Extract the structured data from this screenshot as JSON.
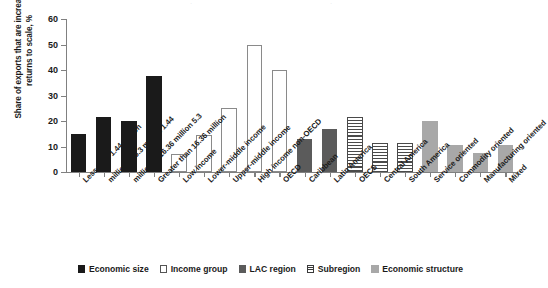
{
  "chart_data": {
    "type": "bar",
    "title": "",
    "subtitle": "",
    "xlabel": "",
    "ylabel": "Share of exports that are increasing returns to scale, %",
    "ylim": [
      0,
      60
    ],
    "yticks": [
      0,
      10,
      20,
      30,
      40,
      50,
      60
    ],
    "grid": false,
    "legend_position": "bottom",
    "categories": [
      "Less than 1.44 million",
      "1.44 million to 5.3 million",
      "5.3 million to 16.36 million",
      "Greater than 16.36 million",
      "Low income",
      "Lower-middle income",
      "Upper-middle income",
      "High income non-OECD",
      "OECD",
      "Caribbean",
      "Latin America",
      "OECS",
      "Central America",
      "South America",
      "Service oriented",
      "Commodity oriented",
      "Manufacturing oriented",
      "Mixed"
    ],
    "values": [
      15,
      21.5,
      20.2,
      37.5,
      7,
      14.5,
      25,
      50,
      40,
      13,
      17,
      21.5,
      11.5,
      11.5,
      20,
      10.5,
      7.5,
      10.5
    ],
    "groups": [
      "Economic size",
      "Economic size",
      "Economic size",
      "Economic size",
      "Income group",
      "Income group",
      "Income group",
      "Income group",
      "Income group",
      "LAC region",
      "LAC region",
      "Subregion",
      "Subregion",
      "Subregion",
      "Economic structure",
      "Economic structure",
      "Economic structure",
      "Economic structure"
    ],
    "styles": [
      "s-black",
      "s-black",
      "s-black",
      "s-black",
      "s-white",
      "s-white",
      "s-white",
      "s-white",
      "s-white",
      "s-lac",
      "s-lac",
      "s-hatch",
      "s-hatch",
      "s-hatch",
      "s-gray",
      "s-gray",
      "s-gray",
      "s-gray"
    ],
    "series": [
      {
        "name": "Share of exports that are increasing returns to scale",
        "values": [
          15,
          21.5,
          20.2,
          37.5,
          7,
          14.5,
          25,
          50,
          40,
          13,
          17,
          21.5,
          11.5,
          11.5,
          20,
          10.5,
          7.5,
          10.5
        ]
      }
    ],
    "legend": [
      {
        "label": "Economic size",
        "style": "s-black",
        "color": "#1a1a1a"
      },
      {
        "label": "Income group",
        "style": "s-white",
        "color": "#ffffff"
      },
      {
        "label": "LAC region",
        "style": "s-lac",
        "color": "#5b5b5b"
      },
      {
        "label": "Subregion",
        "style": "s-hatch",
        "color": "#4a4a4a"
      },
      {
        "label": "Economic structure",
        "style": "s-gray",
        "color": "#a8a8a8"
      }
    ]
  }
}
